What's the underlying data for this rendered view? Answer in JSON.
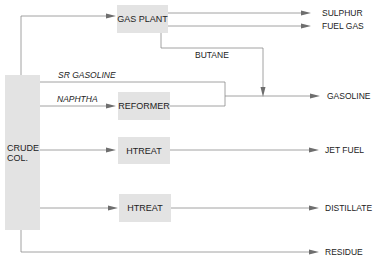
{
  "diagram": {
    "type": "process-flow",
    "colors": {
      "box_fill": "#e3e3e3",
      "line": "#8a8a8a",
      "arrow": "#6e6e6e",
      "text": "#222222"
    },
    "units": {
      "crude_column": "CRUDE\nCOL.",
      "crude_column_line1": "CRUDE",
      "crude_column_line2": "COL.",
      "gas_plant": "GAS PLANT",
      "reformer": "REFORMER",
      "htreat_1": "HTREAT",
      "htreat_2": "HTREAT"
    },
    "streams": {
      "sr_gasoline": "SR GASOLINE",
      "naphtha": "NAPHTHA",
      "butane": "BUTANE"
    },
    "products": {
      "sulphur": "SULPHUR",
      "fuel_gas": "FUEL GAS",
      "gasoline": "GASOLINE",
      "jet_fuel": "JET FUEL",
      "distillate": "DISTILLATE",
      "residue": "RESIDUE"
    },
    "edges": [
      {
        "from": "CRUDE COL.",
        "to": "GAS PLANT"
      },
      {
        "from": "GAS PLANT",
        "to": "SULPHUR"
      },
      {
        "from": "GAS PLANT",
        "to": "FUEL GAS"
      },
      {
        "from": "GAS PLANT",
        "to": "GASOLINE",
        "label": "BUTANE"
      },
      {
        "from": "CRUDE COL.",
        "to": "GASOLINE",
        "label": "SR GASOLINE"
      },
      {
        "from": "CRUDE COL.",
        "to": "REFORMER",
        "label": "NAPHTHA"
      },
      {
        "from": "REFORMER",
        "to": "GASOLINE"
      },
      {
        "from": "CRUDE COL.",
        "to": "HTREAT"
      },
      {
        "from": "HTREAT",
        "to": "JET FUEL"
      },
      {
        "from": "CRUDE COL.",
        "to": "HTREAT"
      },
      {
        "from": "HTREAT",
        "to": "DISTILLATE"
      },
      {
        "from": "CRUDE COL.",
        "to": "RESIDUE"
      }
    ]
  }
}
